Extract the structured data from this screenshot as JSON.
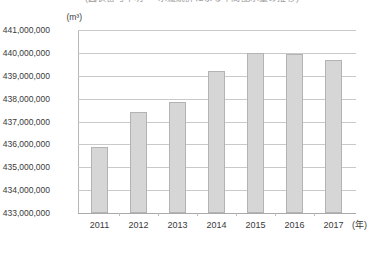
{
  "chart_data": {
    "type": "bar",
    "title": "(図表番号不明 ‥ 水道統計による年間配水量の推移)",
    "title_truncated": true,
    "xlabel": "(年)",
    "ylabel": "(m³)",
    "categories": [
      "2011",
      "2012",
      "2013",
      "2014",
      "2015",
      "2016",
      "2017"
    ],
    "values": [
      435900000,
      437400000,
      437850000,
      439200000,
      440000000,
      439950000,
      439700000
    ],
    "ylim": [
      433000000,
      441000000
    ],
    "ytick_labels": [
      "441,000,000",
      "440,000,000",
      "439,000,000",
      "438,000,000",
      "437,000,000",
      "436,000,000",
      "435,000,000",
      "434,000,000",
      "433,000,000"
    ],
    "ytick_values": [
      441000000,
      440000000,
      439000000,
      438000000,
      437000000,
      436000000,
      435000000,
      434000000,
      433000000
    ],
    "grid": true,
    "legend": null,
    "series_color": "#d6d6d6",
    "series_border_color": "#b3b3b3",
    "gridline_color": "#c9c9c9"
  }
}
